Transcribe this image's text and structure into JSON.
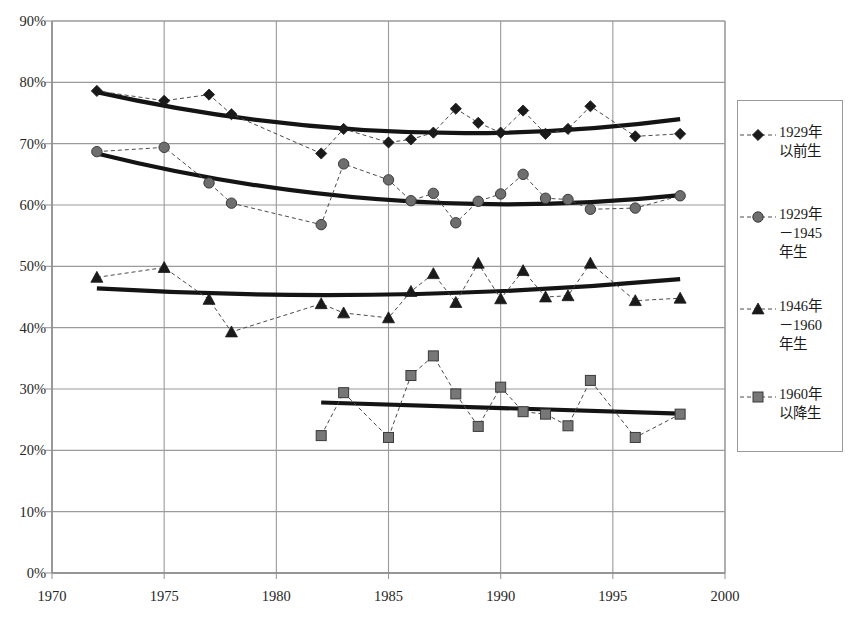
{
  "chart_data": {
    "type": "line",
    "title": "",
    "xlabel": "",
    "ylabel": "",
    "xlim": [
      1970,
      2000
    ],
    "ylim": [
      0,
      0.9
    ],
    "x_ticks": [
      "1970",
      "1975",
      "1980",
      "1985",
      "1990",
      "1995",
      "2000"
    ],
    "x_tick_values": [
      1970,
      1975,
      1980,
      1985,
      1990,
      1995,
      2000
    ],
    "y_ticks": [
      "0%",
      "10%",
      "20%",
      "30%",
      "40%",
      "50%",
      "60%",
      "70%",
      "80%",
      "90%"
    ],
    "y_tick_values": [
      0,
      10,
      20,
      30,
      40,
      50,
      60,
      70,
      80,
      90
    ],
    "grid": true,
    "legend_position": "right",
    "series": [
      {
        "name": "1929年\n以前生",
        "marker": "diamond",
        "marker_color": "#1a1a1a",
        "line_style": "dashed",
        "x": [
          1972,
          1975,
          1977,
          1978,
          1982,
          1983,
          1985,
          1986,
          1987,
          1988,
          1989,
          1990,
          1991,
          1992,
          1993,
          1994,
          1996,
          1998
        ],
        "values": [
          78.6,
          77.0,
          78.0,
          74.8,
          68.4,
          72.4,
          70.2,
          70.7,
          71.8,
          75.7,
          73.4,
          71.8,
          75.4,
          71.6,
          72.4,
          76.1,
          71.2,
          71.6
        ],
        "trend": {
          "type": "quadratic",
          "x_start": 1972,
          "x_end": 1998,
          "y_start": 78.4,
          "y_mid": 72.0,
          "y_end": 74.0
        }
      },
      {
        "name": "1929年\n－1945\n年生",
        "marker": "circle",
        "marker_color": "#6e6e6e",
        "line_style": "dashed",
        "x": [
          1972,
          1975,
          1977,
          1978,
          1982,
          1983,
          1985,
          1986,
          1987,
          1988,
          1989,
          1990,
          1991,
          1992,
          1993,
          1994,
          1996,
          1998
        ],
        "values": [
          68.7,
          69.4,
          63.6,
          60.3,
          56.8,
          66.7,
          64.1,
          60.7,
          61.9,
          57.1,
          60.6,
          61.8,
          65.0,
          61.1,
          60.9,
          59.3,
          59.5,
          61.5
        ],
        "trend": {
          "type": "quadratic",
          "x_start": 1972,
          "x_end": 1998,
          "y_start": 68.4,
          "y_mid": 60.8,
          "y_end": 61.6
        }
      },
      {
        "name": "1946年\n－1960\n年生",
        "marker": "triangle",
        "marker_color": "#1a1a1a",
        "line_style": "dashed",
        "x": [
          1972,
          1975,
          1977,
          1978,
          1982,
          1983,
          1985,
          1986,
          1987,
          1988,
          1989,
          1990,
          1991,
          1992,
          1993,
          1994,
          1996,
          1998
        ],
        "values": [
          48.2,
          49.8,
          44.6,
          39.3,
          43.9,
          42.4,
          41.6,
          45.9,
          48.8,
          44.1,
          50.5,
          44.7,
          49.3,
          45.0,
          45.2,
          50.5,
          44.4,
          44.8
        ],
        "trend": {
          "type": "quadratic",
          "x_start": 1972,
          "x_end": 1998,
          "y_start": 46.4,
          "y_mid": 45.4,
          "y_end": 47.9
        }
      },
      {
        "name": "1960年\n以降生",
        "marker": "square",
        "marker_color": "#777777",
        "line_style": "dashed",
        "x": [
          1982,
          1983,
          1985,
          1986,
          1987,
          1988,
          1989,
          1990,
          1991,
          1992,
          1993,
          1994,
          1996,
          1998
        ],
        "values": [
          22.4,
          29.4,
          22.1,
          32.2,
          35.4,
          29.2,
          23.9,
          30.3,
          26.3,
          25.9,
          24.0,
          31.4,
          22.1,
          25.9
        ],
        "trend": {
          "type": "linear",
          "x_start": 1982,
          "x_end": 1998,
          "y_start": 27.8,
          "y_mid": 26.9,
          "y_end": 26.0
        }
      }
    ]
  },
  "legend": {
    "entries": [
      {
        "label": "1929年\n以前生",
        "marker": "diamond"
      },
      {
        "label": "1929年\n－1945\n年生",
        "marker": "circle"
      },
      {
        "label": "1946年\n－1960\n年生",
        "marker": "triangle"
      },
      {
        "label": "1960年\n以降生",
        "marker": "square"
      }
    ]
  },
  "colors": {
    "axis": "#8c8c8c",
    "grid": "#9a9a9a",
    "marker_dark": "#1a1a1a",
    "marker_gray": "#6e6e6e",
    "trend": "#141414",
    "background": "#ffffff"
  }
}
